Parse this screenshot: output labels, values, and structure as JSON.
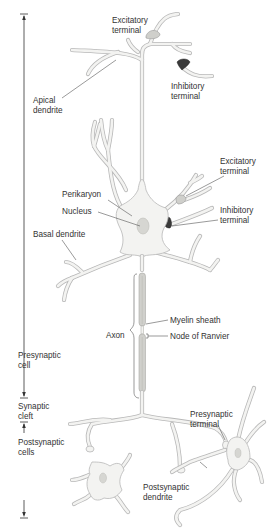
{
  "colors": {
    "cell_fill": "#f3f3f1",
    "cell_outline": "#b8b8b8",
    "nucleus": "#d6d6d2",
    "myelin": "#d0d0cc",
    "inhibitory_terminal": "#3a3a3a",
    "excitatory_terminal": "#cfcfcb",
    "text": "#333333"
  },
  "labels": {
    "excitatory_terminal_top": "Excitatory\nterminal",
    "inhibitory_terminal_top": "Inhibitory\nterminal",
    "apical_dendrite": "Apical\ndendrite",
    "excitatory_terminal_side": "Excitatory\nterminal",
    "perikaryon": "Perikaryon",
    "nucleus": "Nucleus",
    "inhibitory_terminal_side": "Inhibitory\nterminal",
    "basal_dendrite": "Basal dendrite",
    "myelin_sheath": "Myelin sheath",
    "axon": "Axon",
    "node_of_ranvier": "Node of Ranvier",
    "presynaptic_cell": "Presynaptic\ncell",
    "synaptic_cleft": "Synaptic\ncleft",
    "presynaptic_terminal": "Presynaptic\nterminal",
    "postsynaptic_cells": "Postsynaptic\ncells",
    "postsynaptic_dendrite": "Postsynaptic\ndendrite"
  },
  "scale_bars": [
    {
      "name": "presynaptic-cell-span",
      "from_y": 14,
      "to_y": 398
    },
    {
      "name": "synaptic-cleft-span",
      "from_y": 398,
      "to_y": 422
    },
    {
      "name": "postsynaptic-cells-span",
      "from_y": 422,
      "to_y": 518
    }
  ]
}
